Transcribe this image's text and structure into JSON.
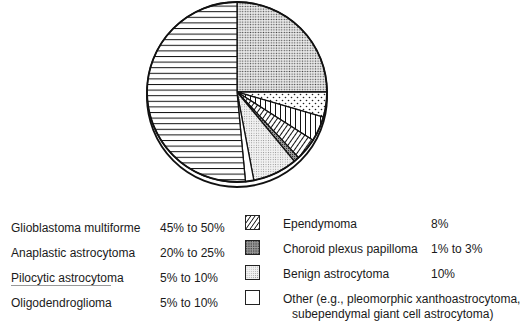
{
  "chart_data": {
    "type": "pie",
    "title": "",
    "pie_center_px": [
      237,
      92
    ],
    "pie_radius_px": 90,
    "start_angle_deg": 0,
    "direction": "clockwise",
    "slices_in_drawing_order": [
      {
        "label": "Anaplastic astrocytoma",
        "pattern": "dense-dot",
        "approx_percent": 25
      },
      {
        "label": "Pilocytic astrocytoma",
        "pattern": "sparse-dot",
        "approx_percent": 4.5
      },
      {
        "label": "Oligodendroglioma",
        "pattern": "vertical-lines",
        "approx_percent": 4.5
      },
      {
        "label": "Ependymoma",
        "pattern": "diagonal-lines",
        "approx_percent": 4
      },
      {
        "label": "Choroid plexus papilloma",
        "pattern": "dark-stipple",
        "approx_percent": 1
      },
      {
        "label": "Benign astrocytoma",
        "pattern": "light-stipple",
        "approx_percent": 8
      },
      {
        "label": "Other",
        "pattern": "white",
        "approx_percent": 1.5
      },
      {
        "label": "Glioblastoma multiforme",
        "pattern": "horizontal-lines",
        "approx_percent": 51.5
      }
    ],
    "legend": [
      {
        "label": "Glioblastoma multiforme",
        "value": "45% to 50%"
      },
      {
        "label": "Anaplastic astrocytoma",
        "value": "20% to 25%"
      },
      {
        "label": "Pilocytic astrocytoma",
        "value": "5% to 10%"
      },
      {
        "label": "Oligodendroglioma",
        "value": "5% to 10%"
      },
      {
        "label": "Ependymoma",
        "value": "8%",
        "swatch": "diagonal-lines"
      },
      {
        "label": "Choroid plexus papilloma",
        "value": "1% to 3%",
        "swatch": "dark-stipple"
      },
      {
        "label": "Benign astrocytoma",
        "value": "10%",
        "swatch": "light-stipple"
      },
      {
        "label": "Other (e.g., pleomorphic xanthoastrocytoma, subependymal giant cell astrocytoma)",
        "value": "",
        "swatch": "white"
      }
    ],
    "legend_position": "bottom"
  },
  "legend_left": [
    {
      "name": "Glioblastoma multiforme",
      "value": "45% to 50%"
    },
    {
      "name": "Anaplastic astrocytoma",
      "value": "20% to 25%"
    },
    {
      "name": "Pilocytic astrocytoma",
      "value": "5% to 10%"
    },
    {
      "name": "Oligodendroglioma",
      "value": "5% to 10%"
    }
  ],
  "legend_right": [
    {
      "name": "Ependymoma",
      "value": "8%",
      "swatch": "diagonal"
    },
    {
      "name": "Choroid plexus papilloma",
      "value": "1% to 3%",
      "swatch": "dark-stipple"
    },
    {
      "name": "Benign astrocytoma",
      "value": "10%",
      "swatch": "light-stipple"
    },
    {
      "name": "Other (e.g., pleomorphic xanthoastrocytoma,",
      "name_line2": "subependymal giant cell astrocytoma)",
      "value": "",
      "swatch": "white"
    }
  ],
  "colors": {
    "ink": "#1a1a1a",
    "paper": "#ffffff",
    "stipple_light": "#d8d8d8",
    "stipple_dark": "#8a8a8a"
  }
}
